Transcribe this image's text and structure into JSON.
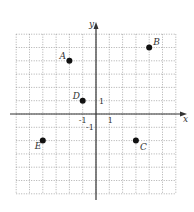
{
  "diagram": {
    "type": "coordinate-plane",
    "grid": {
      "x_min": -6,
      "x_max": 6,
      "y_min": -6,
      "y_max": 6,
      "style": "dotted"
    },
    "axes": {
      "x_label": "x",
      "y_label": "y"
    },
    "ticks": [
      {
        "axis": "y",
        "value": 1,
        "label": "1"
      },
      {
        "axis": "x",
        "value": -1,
        "label": "-1"
      },
      {
        "axis": "x",
        "value": 1,
        "label": "1"
      },
      {
        "axis": "y",
        "value": -1,
        "label": "-1"
      }
    ],
    "points": [
      {
        "name": "A",
        "x": -2,
        "y": 4
      },
      {
        "name": "B",
        "x": 4,
        "y": 5
      },
      {
        "name": "C",
        "x": 3,
        "y": -2
      },
      {
        "name": "D",
        "x": -1,
        "y": 1
      },
      {
        "name": "E",
        "x": -4,
        "y": -2
      }
    ],
    "colors": {
      "grid": "#8a8a8a",
      "axis": "#333333",
      "point": "#111111"
    }
  }
}
